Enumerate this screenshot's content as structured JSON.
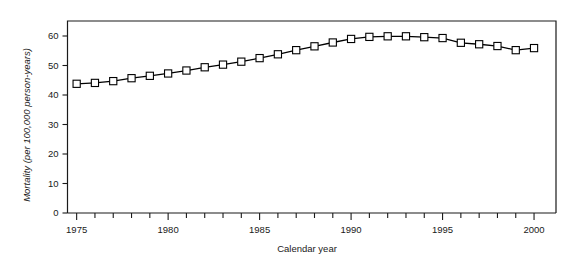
{
  "chart_data": {
    "type": "line",
    "title": "",
    "xlabel": "Calendar year",
    "ylabel": "Mortality (per 100,000 person-years)",
    "xlim": [
      1974.5,
      2001.2
    ],
    "ylim": [
      0,
      66
    ],
    "yticks": [
      0,
      10,
      20,
      30,
      40,
      50,
      60
    ],
    "ytick_labels": [
      "0",
      "10",
      "20",
      "30",
      "40",
      "50",
      "60"
    ],
    "xticks": [
      1975,
      1976,
      1977,
      1978,
      1979,
      1980,
      1981,
      1982,
      1983,
      1984,
      1985,
      1986,
      1987,
      1988,
      1989,
      1990,
      1991,
      1992,
      1993,
      1994,
      1995,
      1996,
      1997,
      1998,
      1999,
      2000
    ],
    "xtick_labels": [
      "1975",
      "1980",
      "1985",
      "1990",
      "1995",
      "2000"
    ],
    "xtick_label_values": [
      1975,
      1980,
      1985,
      1990,
      1995,
      2000
    ],
    "grid": false,
    "legend": "none",
    "marker": "open-square",
    "line_color": "#000000",
    "marker_fill": "#ffffff",
    "marker_edge": "#000000",
    "x": [
      1975,
      1976,
      1977,
      1978,
      1979,
      1980,
      1981,
      1982,
      1983,
      1984,
      1985,
      1986,
      1987,
      1988,
      1989,
      1990,
      1991,
      1992,
      1993,
      1994,
      1995,
      1996,
      1997,
      1998,
      1999,
      2000
    ],
    "values": [
      43.8,
      44.1,
      44.7,
      45.7,
      46.5,
      47.3,
      48.3,
      49.4,
      50.3,
      51.3,
      52.5,
      53.8,
      55.2,
      56.5,
      57.8,
      59.0,
      59.7,
      59.9,
      59.9,
      59.6,
      59.3,
      57.7,
      57.2,
      56.6,
      55.2,
      55.9
    ],
    "series": [
      {
        "name": "Mortality",
        "values": [
          43.8,
          44.1,
          44.7,
          45.7,
          46.5,
          47.3,
          48.3,
          49.4,
          50.3,
          51.3,
          52.5,
          53.8,
          55.2,
          56.5,
          57.8,
          59.0,
          59.7,
          59.9,
          59.9,
          59.6,
          59.3,
          57.7,
          57.2,
          56.6,
          55.2,
          55.9
        ]
      }
    ]
  }
}
